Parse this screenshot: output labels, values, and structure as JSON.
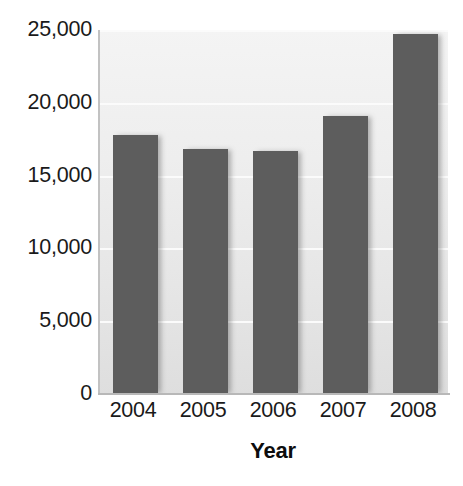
{
  "chart_data": {
    "type": "bar",
    "title": "",
    "subtitle": "",
    "xlabel": "Year",
    "ylabel": "",
    "categories": [
      "2004",
      "2005",
      "2006",
      "2007",
      "2008"
    ],
    "values": [
      17800,
      16800,
      16700,
      19100,
      24700
    ],
    "series": [
      {
        "name": "Value",
        "values": [
          17800,
          16800,
          16700,
          19100,
          24700
        ],
        "color": "#5d5d5d"
      }
    ],
    "ylim": [
      0,
      25000
    ],
    "y_ticks": [
      0,
      5000,
      10000,
      15000,
      20000,
      25000
    ],
    "y_tick_labels": [
      "0",
      "5,000",
      "10,000",
      "15,000",
      "20,000",
      "25,000"
    ],
    "x_tick_labels": [
      "2004",
      "2005",
      "2006",
      "2007",
      "2008"
    ],
    "grid": true,
    "grid_axis": "y",
    "legend": false,
    "legend_position": "none",
    "annotations": [],
    "plot_background": "#ebebeb",
    "gridline_color": "#fbfbfb",
    "bar_color": "#5d5d5d",
    "axis_color": "#b8b8b8",
    "text_color": "#1a1a1a"
  },
  "axis": {
    "y_labels": [
      {
        "text": "25,000",
        "value": 25000
      },
      {
        "text": "20,000",
        "value": 20000
      },
      {
        "text": "15,000",
        "value": 15000
      },
      {
        "text": "10,000",
        "value": 10000
      },
      {
        "text": "5,000",
        "value": 5000
      },
      {
        "text": "0",
        "value": 0
      }
    ],
    "x_labels": [
      {
        "text": "2004"
      },
      {
        "text": "2005"
      },
      {
        "text": "2006"
      },
      {
        "text": "2007"
      },
      {
        "text": "2008"
      }
    ],
    "x_title": "Year"
  }
}
